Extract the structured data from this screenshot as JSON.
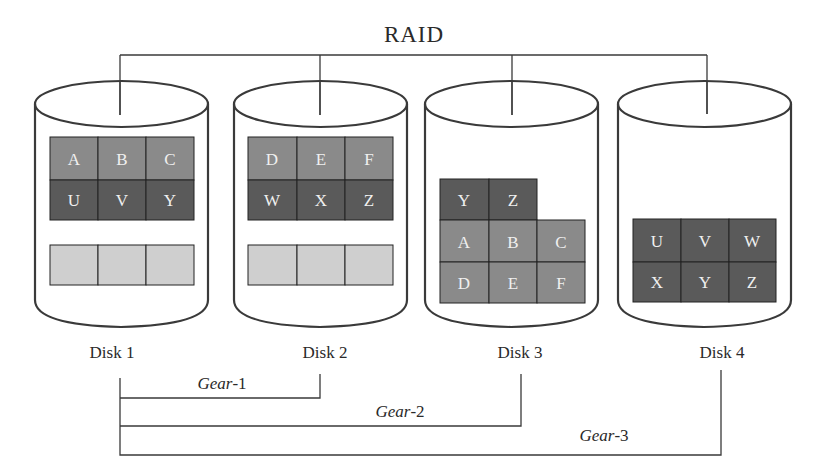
{
  "title": "RAID",
  "colors": {
    "line": "#3a3a3a",
    "block_light": "#8a8a8a",
    "block_dark": "#5a5a5a",
    "block_empty": "#cfcfcf",
    "cell_text": "#f0f0f0"
  },
  "disks": [
    {
      "label": "Disk 1",
      "rows": [
        {
          "shade": "light",
          "cells": [
            "A",
            "B",
            "C"
          ]
        },
        {
          "shade": "dark",
          "cells": [
            "U",
            "V",
            "Y"
          ]
        }
      ],
      "empty_row": [
        "",
        "",
        ""
      ]
    },
    {
      "label": "Disk 2",
      "rows": [
        {
          "shade": "light",
          "cells": [
            "D",
            "E",
            "F"
          ]
        },
        {
          "shade": "dark",
          "cells": [
            "W",
            "X",
            "Z"
          ]
        }
      ],
      "empty_row": [
        "",
        "",
        ""
      ]
    },
    {
      "label": "Disk 3",
      "rows": [
        {
          "shade": "dark",
          "cells": [
            "Y",
            "Z"
          ]
        },
        {
          "shade": "light",
          "cells": [
            "A",
            "B",
            "C"
          ]
        },
        {
          "shade": "light",
          "cells": [
            "D",
            "E",
            "F"
          ]
        }
      ]
    },
    {
      "label": "Disk 4",
      "rows": [
        {
          "shade": "dark",
          "cells": [
            "U",
            "V",
            "W"
          ]
        },
        {
          "shade": "dark",
          "cells": [
            "X",
            "Y",
            "Z"
          ]
        }
      ]
    }
  ],
  "gears": [
    {
      "prefix": "Gear",
      "suffix": "-1",
      "spans": "Disk 1 - Disk 2"
    },
    {
      "prefix": "Gear",
      "suffix": "-2",
      "spans": "Disk 1 - Disk 3"
    },
    {
      "prefix": "Gear",
      "suffix": "-3",
      "spans": "Disk 1 - Disk 4"
    }
  ]
}
